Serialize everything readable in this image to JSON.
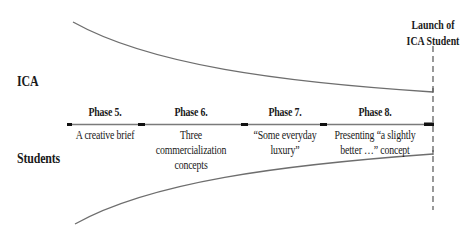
{
  "labels": {
    "ica": "ICA",
    "students": "Students",
    "launch_line1": "Launch of",
    "launch_line2": "ICA Student"
  },
  "phases": [
    {
      "title": "Phase 5.",
      "desc_line1": "A creative brief",
      "desc_line2": "",
      "desc_line3": ""
    },
    {
      "title": "Phase 6.",
      "desc_line1": "Three",
      "desc_line2": "commercialization",
      "desc_line3": "concepts"
    },
    {
      "title": "Phase 7.",
      "desc_line1": "“Some everyday",
      "desc_line2": "luxury”",
      "desc_line3": ""
    },
    {
      "title": "Phase 8.",
      "desc_line1": "Presenting “a slightly",
      "desc_line2": "better …” concept",
      "desc_line3": ""
    }
  ],
  "colors": {
    "line": "#6e6e6e",
    "tick": "#111111",
    "text": "#1a1a1a"
  }
}
